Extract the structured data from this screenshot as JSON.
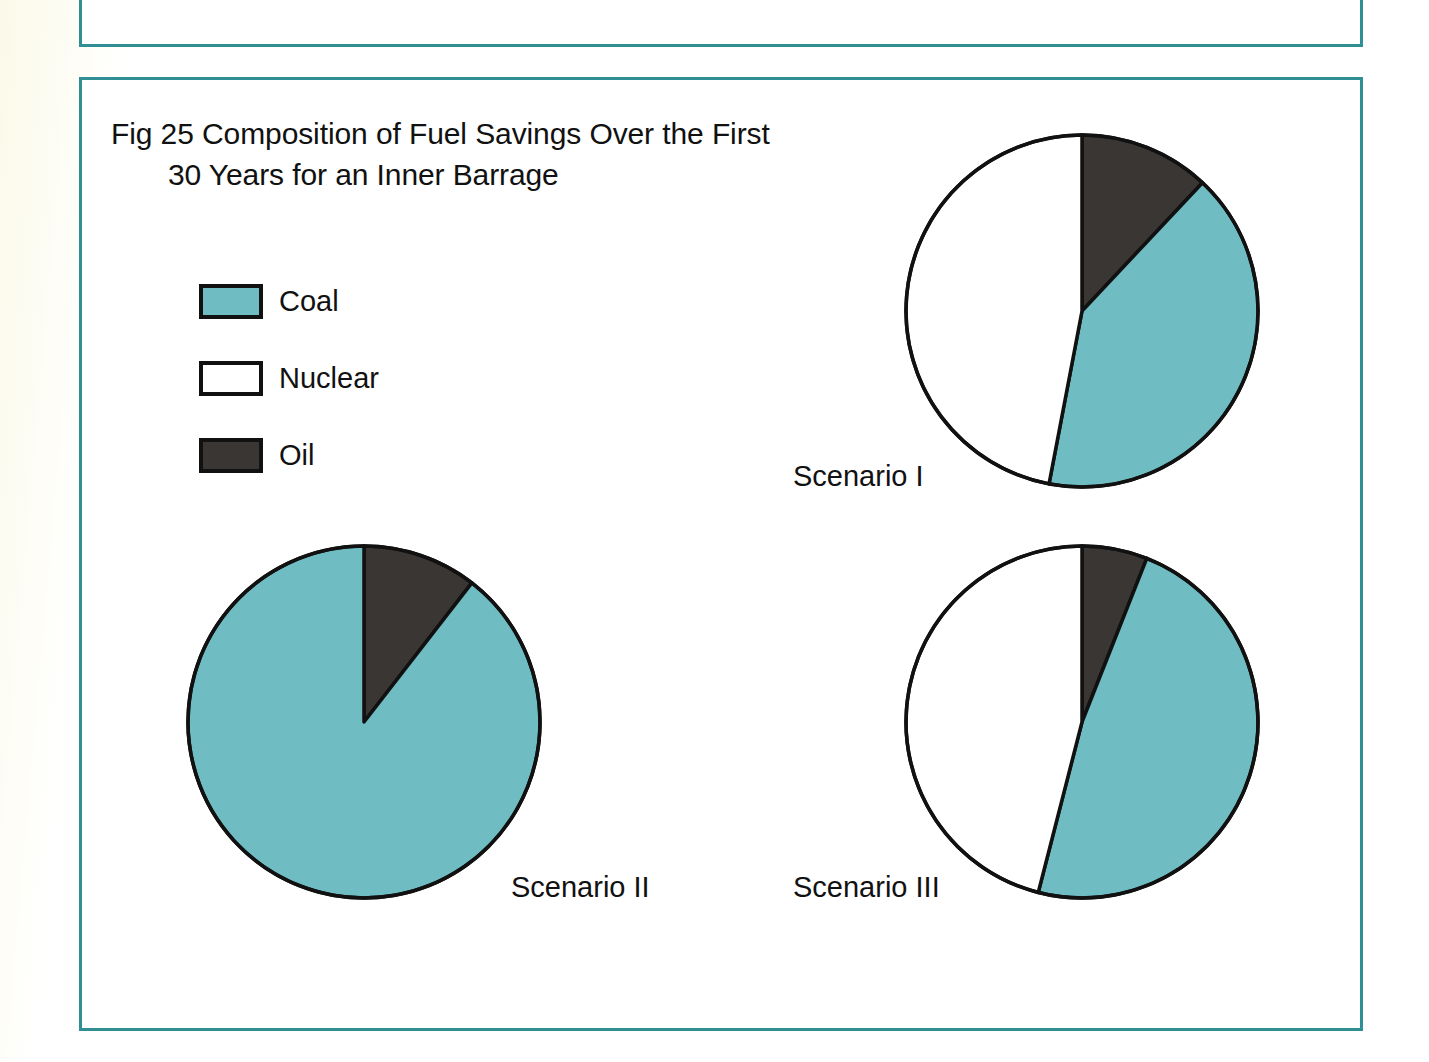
{
  "figure": {
    "title_line_1": "Fig 25 Composition of Fuel Savings Over the First",
    "title_line_2": "30 Years for an Inner Barrage"
  },
  "legend": {
    "items": [
      {
        "label": "Coal",
        "color": "#6fbcc3",
        "key": "coal"
      },
      {
        "label": "Nuclear",
        "color": "#ffffff",
        "key": "nuclear"
      },
      {
        "label": "Oil",
        "color": "#3a3634",
        "key": "oil"
      }
    ]
  },
  "labels": {
    "scenario_1": "Scenario I",
    "scenario_2": "Scenario II",
    "scenario_3": "Scenario III"
  },
  "colors": {
    "coal": "#6fbcc3",
    "nuclear": "#ffffff",
    "oil": "#3a3634",
    "outline": "#111111",
    "frame_border": "#2f8f94",
    "page_background": "#fdfcf1",
    "panel_background": "#ffffff"
  },
  "chart_data": [
    {
      "type": "pie",
      "title": "Scenario I",
      "categories": [
        "Oil",
        "Coal",
        "Nuclear"
      ],
      "values": [
        12,
        41,
        47
      ],
      "unit": "percent",
      "start_angle_deg": 0,
      "direction": "clockwise",
      "slice_colors": [
        "#3a3634",
        "#6fbcc3",
        "#ffffff"
      ],
      "legend_position": "upper-left"
    },
    {
      "type": "pie",
      "title": "Scenario II",
      "categories": [
        "Oil",
        "Coal",
        "Nuclear"
      ],
      "values": [
        10.5,
        89.5,
        0
      ],
      "unit": "percent",
      "start_angle_deg": 0,
      "direction": "clockwise",
      "slice_colors": [
        "#3a3634",
        "#6fbcc3",
        "#ffffff"
      ],
      "legend_position": "upper-left"
    },
    {
      "type": "pie",
      "title": "Scenario III",
      "categories": [
        "Oil",
        "Coal",
        "Nuclear"
      ],
      "values": [
        6,
        48,
        46
      ],
      "unit": "percent",
      "start_angle_deg": 0,
      "direction": "clockwise",
      "slice_colors": [
        "#3a3634",
        "#6fbcc3",
        "#ffffff"
      ],
      "legend_position": "upper-left"
    }
  ],
  "geometry": {
    "pies": [
      {
        "name": "scenario_1",
        "cx": 1082,
        "cy": 311,
        "r": 176
      },
      {
        "name": "scenario_2",
        "cx": 364,
        "cy": 722,
        "r": 176
      },
      {
        "name": "scenario_3",
        "cx": 1082,
        "cy": 722,
        "r": 176
      }
    ]
  }
}
